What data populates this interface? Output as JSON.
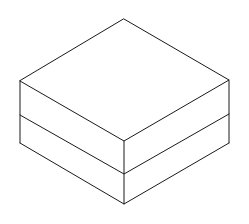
{
  "diagram": {
    "type": "isometric-stacked-boxes",
    "stroke_color": "#1a1a1a",
    "background": "#ffffff",
    "layers": 2,
    "vertices": {
      "top_back": [
        124,
        19
      ],
      "top_left": [
        20,
        81
      ],
      "top_right": [
        229,
        80
      ],
      "top_front": [
        124,
        141
      ],
      "mid_left": [
        20,
        115
      ],
      "mid_right": [
        229,
        114
      ],
      "mid_front": [
        124,
        174
      ],
      "bottom_left": [
        20,
        143
      ],
      "bottom_right": [
        229,
        143
      ],
      "bottom_front": [
        124,
        204
      ]
    }
  }
}
